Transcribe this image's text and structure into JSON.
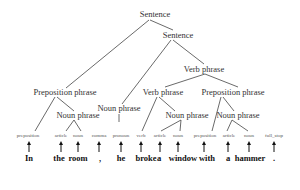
{
  "diagram": {
    "type": "parse-tree",
    "nodes": {
      "s1": "Sentence",
      "s2": "Sentence",
      "vp_outer": "Verb phrase",
      "pp_left": "Preposition phrase",
      "vp_inner": "Verb phrase",
      "pp_right": "Preposition phrase",
      "np_room": "Noun phrase",
      "np_he": "Noun phrase",
      "np_window": "Noun phrase",
      "np_hammer": "Noun phrase"
    },
    "tokens": [
      {
        "pos": "preposition",
        "word": "In"
      },
      {
        "pos": "article",
        "word": "the"
      },
      {
        "pos": "noun",
        "word": "room"
      },
      {
        "pos": "comma",
        "word": ","
      },
      {
        "pos": "pronoun",
        "word": "he"
      },
      {
        "pos": "verb",
        "word": "broke"
      },
      {
        "pos": "article",
        "word": "a"
      },
      {
        "pos": "noun",
        "word": "window"
      },
      {
        "pos": "preposition",
        "word": "with"
      },
      {
        "pos": "article",
        "word": "a"
      },
      {
        "pos": "noun",
        "word": "hammer"
      },
      {
        "pos": "full_stop",
        "word": "."
      }
    ]
  }
}
